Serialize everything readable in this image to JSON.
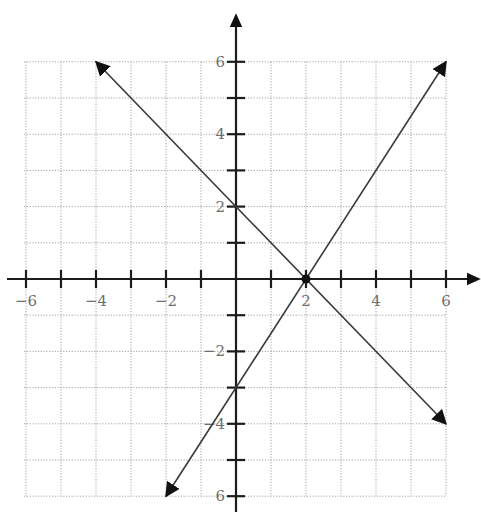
{
  "chart_data": {
    "type": "line",
    "title": "",
    "xlabel": "",
    "ylabel": "",
    "xlim": [
      -6,
      6
    ],
    "ylim": [
      -6,
      6
    ],
    "grid": true,
    "grid_step": 1,
    "x_tick_labels": [
      {
        "value": -6,
        "label": "−6"
      },
      {
        "value": -4,
        "label": "−4"
      },
      {
        "value": -2,
        "label": "−2"
      },
      {
        "value": 2,
        "label": "2"
      },
      {
        "value": 4,
        "label": "4"
      },
      {
        "value": 6,
        "label": "6"
      }
    ],
    "y_tick_labels": [
      {
        "value": 6,
        "label": "6"
      },
      {
        "value": 4,
        "label": "4"
      },
      {
        "value": 2,
        "label": "2"
      },
      {
        "value": -2,
        "label": "−2"
      },
      {
        "value": -4,
        "label": "−4"
      },
      {
        "value": -6,
        "label": "6"
      }
    ],
    "series": [
      {
        "name": "y = -x + 2",
        "points": [
          [
            -4,
            6
          ],
          [
            6,
            -4
          ]
        ],
        "arrows": "both"
      },
      {
        "name": "y = 1.5x - 3",
        "points": [
          [
            -2,
            -6
          ],
          [
            6,
            6
          ]
        ],
        "arrows": "both"
      }
    ],
    "annotations": [
      {
        "type": "point",
        "x": 2,
        "y": 0,
        "label": "intersection"
      }
    ],
    "legend": null
  },
  "colors": {
    "axis": "#1c1c1c",
    "line": "#3a3a3a",
    "grid": "#9a9a9a",
    "label": "#6e6e6e"
  }
}
